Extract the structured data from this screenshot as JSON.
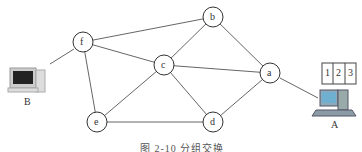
{
  "diagram": {
    "type": "network-graph",
    "nodes": [
      {
        "id": "f",
        "label": "f",
        "x": 83,
        "y": 42
      },
      {
        "id": "b",
        "label": "b",
        "x": 213,
        "y": 17
      },
      {
        "id": "c",
        "label": "c",
        "x": 164,
        "y": 65
      },
      {
        "id": "a",
        "label": "a",
        "x": 270,
        "y": 73
      },
      {
        "id": "e",
        "label": "e",
        "x": 97,
        "y": 122
      },
      {
        "id": "d",
        "label": "d",
        "x": 213,
        "y": 122
      }
    ],
    "edges": [
      [
        "f",
        "b"
      ],
      [
        "f",
        "c"
      ],
      [
        "f",
        "e"
      ],
      [
        "b",
        "c"
      ],
      [
        "b",
        "a"
      ],
      [
        "c",
        "a"
      ],
      [
        "c",
        "e"
      ],
      [
        "c",
        "d"
      ],
      [
        "e",
        "d"
      ],
      [
        "d",
        "a"
      ]
    ],
    "hosts": [
      {
        "id": "B",
        "label": "B",
        "connects_to": "f"
      },
      {
        "id": "A",
        "label": "A",
        "connects_to": "a"
      }
    ],
    "packets": [
      "1",
      "2",
      "3"
    ],
    "caption": "图 2-10  分组交换"
  }
}
